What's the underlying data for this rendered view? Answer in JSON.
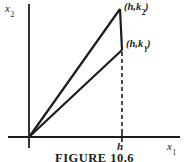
{
  "figure": {
    "caption": "FIGURE 10.6",
    "axis_y": {
      "base": "x",
      "sub": "2"
    },
    "axis_x": {
      "base": "x",
      "sub": "1"
    },
    "tick_label": "h",
    "points": [
      {
        "pre": "(h,k",
        "sub": "2",
        "post": ")"
      },
      {
        "pre": "(h,k",
        "sub": "1",
        "post": ")"
      }
    ],
    "colors": {
      "ink": "#1c1c1c",
      "background": "#ffffff"
    }
  }
}
